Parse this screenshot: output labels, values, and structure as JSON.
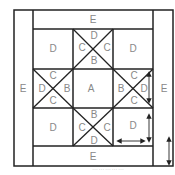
{
  "diagram": {
    "type": "quilt-block-layout",
    "labels": {
      "center": "A",
      "star_point_inner": "B",
      "star_point_side": "C",
      "corner": "D",
      "border": "E"
    },
    "blocks": [
      {
        "id": "top-border",
        "letter": "E"
      },
      {
        "id": "bottom-border",
        "letter": "E"
      },
      {
        "id": "left-border",
        "letter": "E"
      },
      {
        "id": "right-border",
        "letter": "E"
      },
      {
        "id": "corner-top-left",
        "letter": "D"
      },
      {
        "id": "corner-top-right",
        "letter": "D"
      },
      {
        "id": "corner-bottom-left",
        "letter": "D"
      },
      {
        "id": "corner-bottom-right",
        "letter": "D"
      },
      {
        "id": "center",
        "letter": "A"
      }
    ],
    "hourglass_top": {
      "top": "D",
      "left": "C",
      "right": "C",
      "bottom": "B"
    },
    "hourglass_left": {
      "top": "C",
      "left": "D",
      "right": "B",
      "bottom": "C"
    },
    "hourglass_right": {
      "top": "C",
      "left": "B",
      "right": "D",
      "bottom": "C"
    },
    "hourglass_bottom": {
      "top": "B",
      "left": "C",
      "right": "C",
      "bottom": "D"
    },
    "caption": "……………"
  }
}
